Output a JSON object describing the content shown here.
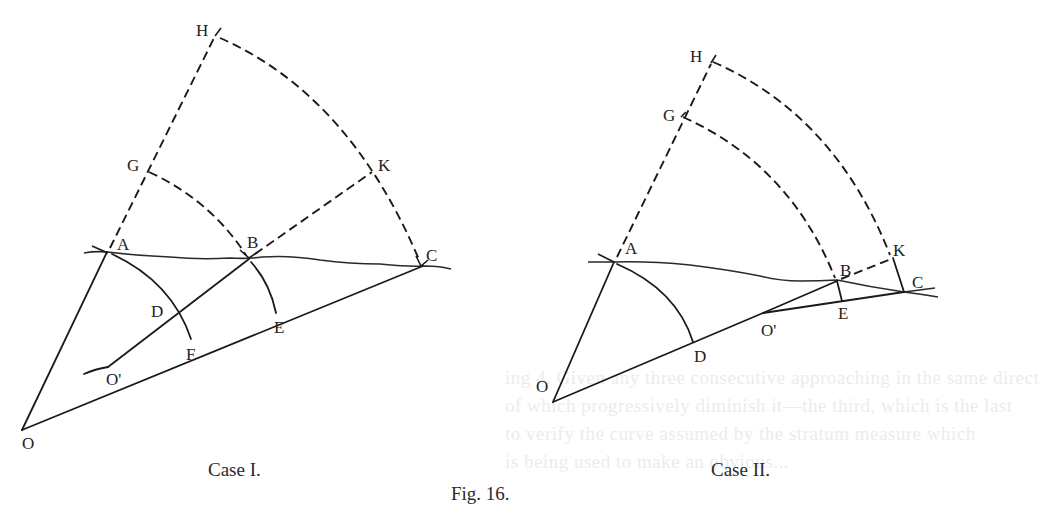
{
  "figure": {
    "title": "Fig. 16.",
    "background_color": "#ffffff",
    "ink_color": "#1a1a1a"
  },
  "case_1": {
    "caption": "Case I.",
    "labels": {
      "H": "H",
      "G": "G",
      "K": "K",
      "A": "A",
      "B": "B",
      "C": "C",
      "D": "D",
      "E": "E",
      "F": "F",
      "O_prime": "O'",
      "O": "O"
    },
    "points": {
      "H": [
        218,
        35
      ],
      "G": [
        148,
        171
      ],
      "A": [
        107,
        252
      ],
      "K": [
        373,
        171
      ],
      "B": [
        249,
        259
      ],
      "C": [
        423,
        266
      ],
      "D": [
        180,
        312
      ],
      "F": [
        191,
        339
      ],
      "E": [
        276,
        313
      ],
      "O_prime": [
        108,
        367
      ],
      "O": [
        22,
        430
      ]
    },
    "solid_lines": [
      "O-A",
      "O-C",
      "O'-B",
      "A-F arc",
      "B-E arc"
    ],
    "dashed_lines": [
      "A-H",
      "G-B arc",
      "B-K",
      "H-C arc"
    ],
    "curve": "A-B-C wavy line"
  },
  "case_2": {
    "caption": "Case II.",
    "labels": {
      "H": "H",
      "G": "G",
      "A": "A",
      "K": "K",
      "B": "B",
      "C": "C",
      "D": "D",
      "E": "E",
      "O_prime": "O'",
      "O": "O"
    },
    "points": {
      "H": [
        712,
        62
      ],
      "G": [
        682,
        117
      ],
      "A": [
        614,
        262
      ],
      "K": [
        893,
        258
      ],
      "B": [
        837,
        281
      ],
      "C": [
        904,
        292
      ],
      "D": [
        693,
        342
      ],
      "O_prime": [
        763,
        313
      ],
      "E": [
        842,
        301
      ],
      "O": [
        553,
        402
      ]
    },
    "solid_lines": [
      "O-A",
      "O-O'",
      "O'-B",
      "O'-C",
      "A-D arc",
      "B-E",
      "K-C"
    ],
    "dashed_lines": [
      "A-H",
      "G-B arc",
      "H-K arc",
      "B-K"
    ],
    "curve": "A-B-C wavy line"
  },
  "bleed_through_text": [
    "ing 4. Given any three consecutive approaching in the same direct",
    "of which progressively diminish it—the third, which is the last",
    "to verify the curve assumed by the stratum measure which",
    "is being used to make an obvious..."
  ]
}
